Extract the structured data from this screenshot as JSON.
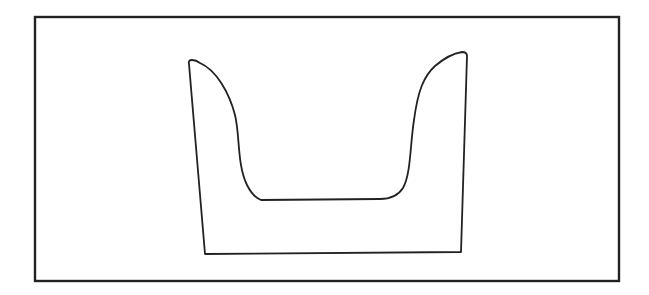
{
  "diagram": {
    "colors": {
      "background": "#ffffff",
      "stroke": "#222222"
    },
    "frame": {
      "x": 34,
      "y": 16,
      "width": 585,
      "height": 265
    },
    "shape": {
      "top_left": [
        188,
        50
      ],
      "top_right": [
        467,
        42
      ],
      "bottom_left": [
        205,
        254
      ],
      "bottom_right": [
        459,
        252
      ],
      "inner_floor_y": 175
    }
  }
}
